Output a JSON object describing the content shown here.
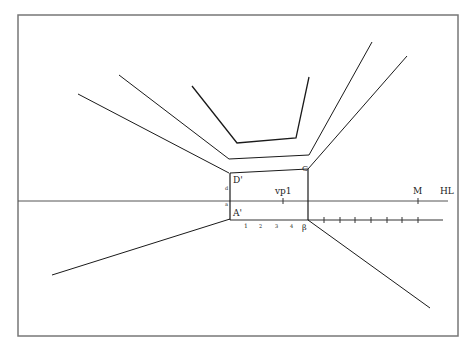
{
  "diagram": {
    "type": "one-point perspective construction",
    "colors": {
      "line": "#1a1a1a",
      "frame": "#777777",
      "horizon": "#555555"
    },
    "labels": {
      "d_prime": "D'",
      "a_prime": "A'",
      "c": "C",
      "beta": "β",
      "vp1": "vp1",
      "m": "M",
      "hl": "HL",
      "small_a": "a",
      "small_d": "d"
    },
    "tick_labels": [
      "1",
      "2",
      "3",
      "4"
    ]
  }
}
